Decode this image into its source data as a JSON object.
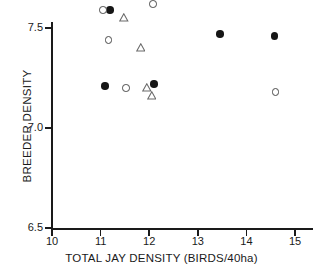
{
  "chart_data": {
    "type": "scatter",
    "title": "",
    "xlabel": "TOTAL JAY DENSITY (BIRDS/40ha)",
    "ylabel": "BREEDER DENSITY",
    "xlim": [
      10,
      15.4
    ],
    "ylim": [
      6.5,
      8.62
    ],
    "xticks": [
      10,
      11,
      12,
      13,
      14,
      15
    ],
    "xticklabels": [
      "10",
      "11",
      "12",
      "13",
      "14",
      "15"
    ],
    "yticks": [
      6.5,
      7.0,
      7.5,
      8.0,
      8.5
    ],
    "yticklabels": [
      "6.5",
      "7.0",
      "7.5",
      "8.0",
      "8.5"
    ],
    "grid": false,
    "legend": "none",
    "series": [
      {
        "name": "filled-circle",
        "marker": "filled-circle",
        "color": "#161616",
        "points": [
          {
            "x": 11.09,
            "y": 7.21
          },
          {
            "x": 11.19,
            "y": 7.59
          },
          {
            "x": 11.46,
            "y": 7.73
          },
          {
            "x": 11.9,
            "y": 8.09
          },
          {
            "x": 12.1,
            "y": 7.22
          },
          {
            "x": 12.44,
            "y": 7.68
          },
          {
            "x": 13.46,
            "y": 7.47
          },
          {
            "x": 13.62,
            "y": 8.0
          },
          {
            "x": 14.58,
            "y": 7.46
          }
        ]
      },
      {
        "name": "open-circle",
        "marker": "open-circle",
        "color": "#4a4a4a",
        "points": [
          {
            "x": 11.05,
            "y": 7.59
          },
          {
            "x": 11.16,
            "y": 7.44
          },
          {
            "x": 11.52,
            "y": 7.2
          },
          {
            "x": 11.94,
            "y": 7.73
          },
          {
            "x": 12.08,
            "y": 7.62
          },
          {
            "x": 12.32,
            "y": 8.0
          },
          {
            "x": 13.44,
            "y": 8.09
          },
          {
            "x": 14.6,
            "y": 7.18
          }
        ]
      },
      {
        "name": "open-triangle",
        "marker": "open-triangle",
        "color": "#6a6a6a",
        "points": [
          {
            "x": 11.48,
            "y": 7.58
          },
          {
            "x": 11.82,
            "y": 7.43
          },
          {
            "x": 11.95,
            "y": 7.23
          },
          {
            "x": 12.03,
            "y": 8.0
          },
          {
            "x": 12.05,
            "y": 7.19
          },
          {
            "x": 13.48,
            "y": 7.77
          },
          {
            "x": 14.58,
            "y": 7.76
          }
        ]
      }
    ]
  }
}
